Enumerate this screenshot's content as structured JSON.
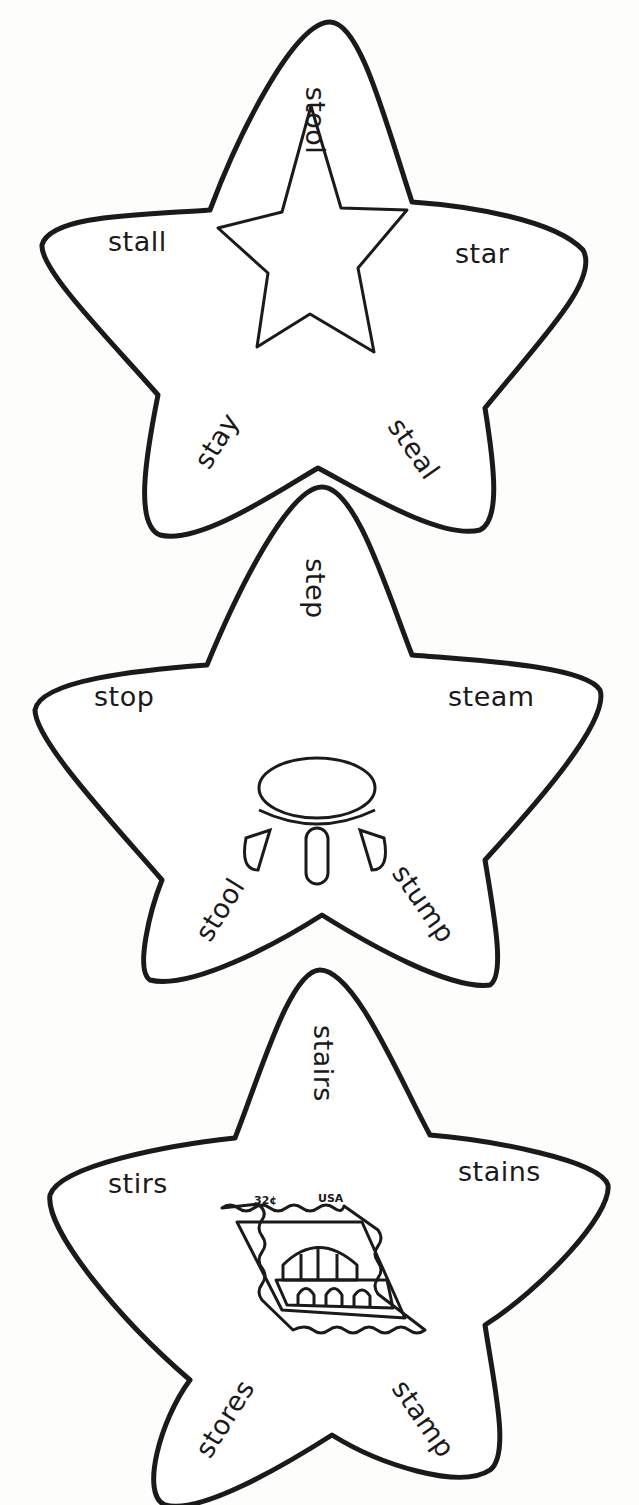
{
  "worksheet": {
    "stroke_color": "#1a1a1a",
    "background": "#fdfdfb",
    "stars": [
      {
        "picture": "star-icon",
        "words": {
          "top": "stool",
          "left": "stall",
          "right": "star",
          "bottom_left": "stay",
          "bottom_right": "steal"
        }
      },
      {
        "picture": "stool-icon",
        "words": {
          "top": "step",
          "left": "stop",
          "right": "steam",
          "bottom_left": "stool",
          "bottom_right": "stump"
        }
      },
      {
        "picture": "postage-stamp-icon",
        "stamp": {
          "value": "32¢",
          "country": "USA"
        },
        "words": {
          "top": "stairs",
          "left": "stirs",
          "right": "stains",
          "bottom_left": "stores",
          "bottom_right": "stamp"
        }
      }
    ]
  }
}
